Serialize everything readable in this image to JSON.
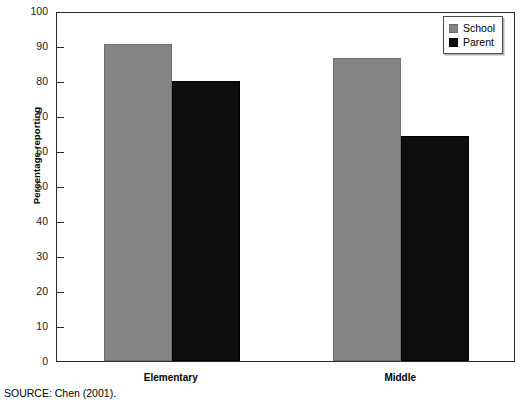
{
  "chart_data": {
    "type": "bar",
    "title": "",
    "xlabel": "",
    "ylabel": "Percentage reporting",
    "ylim": [
      0,
      100
    ],
    "ytick_step": 10,
    "yticks": [
      0,
      10,
      20,
      30,
      40,
      50,
      60,
      70,
      80,
      90,
      100
    ],
    "ytick_labels": [
      "0",
      "10",
      "20",
      "30",
      "40",
      "50",
      "60",
      "70",
      "80",
      "90",
      "100"
    ],
    "grid": false,
    "legend_position": "top-right",
    "categories": [
      "Elementary",
      "Middle"
    ],
    "series": [
      {
        "name": "School",
        "color": "#848484",
        "values": [
          90.5,
          86.7
        ]
      },
      {
        "name": "Parent",
        "color": "#0d0d0d",
        "values": [
          80.0,
          64.4
        ]
      }
    ],
    "annotations": [
      "SOURCE: Chen (2001)."
    ]
  },
  "figure": {
    "source_note": "SOURCE: Chen (2001)."
  },
  "legend": {
    "items": [
      {
        "label": "School"
      },
      {
        "label": "Parent"
      }
    ]
  }
}
